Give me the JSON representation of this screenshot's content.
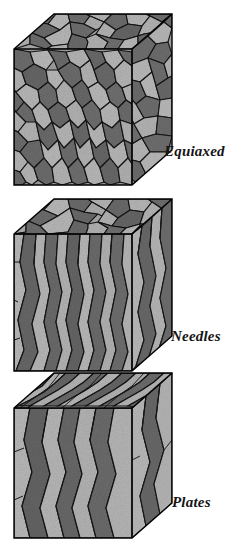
{
  "figure": {
    "background_color": "#ffffff",
    "ink_color": "#151515"
  },
  "palette": {
    "grain_light": "#b9b9b9",
    "grain_mid": "#9a9a9a",
    "grain_dark": "#707070",
    "grain_darker": "#5c5c5c",
    "boundary": "#111111",
    "outline": "#000000"
  },
  "cubes": [
    {
      "id": "equiaxed",
      "label": "Equiaxed",
      "label_position": {
        "x": 164,
        "y": 144
      },
      "origin": {
        "x": 14,
        "y": 14
      },
      "front": {
        "x": 14,
        "y": 49,
        "w": 118,
        "h": 136
      },
      "depth": {
        "dx": 40,
        "dy": -35
      },
      "grain_shape": "equiaxed",
      "top_face_grains": "equiaxed",
      "front_face_grains": "equiaxed",
      "right_face_grains": "equiaxed"
    },
    {
      "id": "needles",
      "label": "Needles",
      "label_position": {
        "x": 171,
        "y": 329
      },
      "origin": {
        "x": 14,
        "y": 199
      },
      "front": {
        "x": 14,
        "y": 247,
        "w": 118,
        "h": 124
      },
      "depth": {
        "dx": 40,
        "dy": -35
      },
      "grain_shape": "needles",
      "top_face_grains": "equiaxed",
      "front_face_grains": "columnar",
      "right_face_grains": "columnar"
    },
    {
      "id": "plates",
      "label": "Plates",
      "label_position": {
        "x": 172,
        "y": 495
      },
      "origin": {
        "x": 14,
        "y": 373
      },
      "front": {
        "x": 14,
        "y": 418,
        "w": 118,
        "h": 120
      },
      "depth": {
        "dx": 40,
        "dy": -35
      },
      "grain_shape": "plates",
      "top_face_grains": "plate-elongated",
      "front_face_grains": "plate-columnar",
      "right_face_grains": "plate-columnar"
    }
  ],
  "labels": {
    "equiaxed": "Equiaxed",
    "needles": "Needles",
    "plates": "Plates"
  }
}
